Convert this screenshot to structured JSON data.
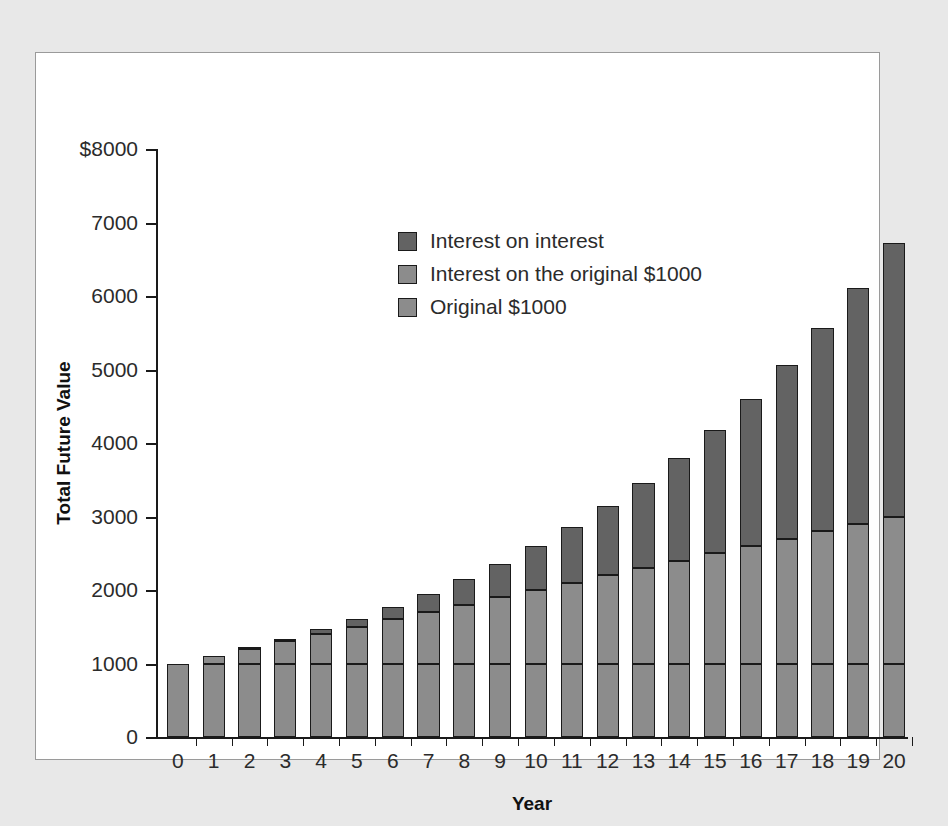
{
  "chart_data": {
    "type": "bar",
    "stacked": true,
    "title": "",
    "xlabel": "Year",
    "ylabel": "Total Future Value",
    "ylim": [
      0,
      8000
    ],
    "ytick_step": 1000,
    "ytick_labels": [
      "$8000",
      "7000",
      "6000",
      "5000",
      "4000",
      "3000",
      "2000",
      "1000",
      "0"
    ],
    "ytick_values": [
      8000,
      7000,
      6000,
      5000,
      4000,
      3000,
      2000,
      1000,
      0
    ],
    "grid": false,
    "legend_position": "inside-upper-left",
    "categories": [
      "0",
      "1",
      "2",
      "3",
      "4",
      "5",
      "6",
      "7",
      "8",
      "9",
      "10",
      "11",
      "12",
      "13",
      "14",
      "15",
      "16",
      "17",
      "18",
      "19",
      "20"
    ],
    "series": [
      {
        "name": "Original $1000",
        "color": "#8c8c8c",
        "values": [
          1000,
          1000,
          1000,
          1000,
          1000,
          1000,
          1000,
          1000,
          1000,
          1000,
          1000,
          1000,
          1000,
          1000,
          1000,
          1000,
          1000,
          1000,
          1000,
          1000,
          1000
        ]
      },
      {
        "name": "Interest on the original $1000",
        "color": "#8c8c8c",
        "values": [
          0,
          100,
          200,
          300,
          400,
          500,
          600,
          700,
          800,
          900,
          1000,
          1100,
          1200,
          1300,
          1400,
          1500,
          1600,
          1700,
          1800,
          1900,
          2000
        ]
      },
      {
        "name": "Interest on interest",
        "color": "#636363",
        "values": [
          0,
          0,
          10,
          31,
          64,
          111,
          172,
          249,
          344,
          458,
          594,
          753,
          938,
          1152,
          1397,
          1677,
          1995,
          2355,
          2760,
          3215,
          3727
        ]
      }
    ],
    "totals": [
      1000,
      1100,
      1210,
      1331,
      1464,
      1611,
      1772,
      1949,
      2144,
      2358,
      2594,
      2853,
      3138,
      3452,
      3797,
      4177,
      4595,
      5054,
      5560,
      6116,
      6727
    ]
  },
  "legend": {
    "items": [
      {
        "label": "Interest on interest",
        "swatch_class": "seg-top"
      },
      {
        "label": "Interest on the original $1000",
        "swatch_class": "seg-mid"
      },
      {
        "label": "Original $1000",
        "swatch_class": "seg-base"
      }
    ]
  }
}
